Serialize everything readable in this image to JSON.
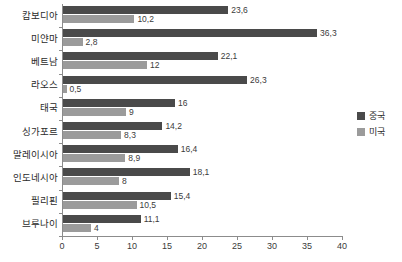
{
  "chart_data": {
    "type": "bar",
    "orientation": "horizontal",
    "title": "",
    "subtitle": "",
    "xlabel": "",
    "ylabel": "",
    "xlim": [
      0,
      40
    ],
    "xticks": [
      0,
      5,
      10,
      15,
      20,
      25,
      30,
      35,
      40
    ],
    "xtick_labels": [
      "0",
      "5",
      "10",
      "15",
      "20",
      "25",
      "30",
      "35",
      "40"
    ],
    "grid": false,
    "legend_position": "right",
    "decimal_separator": ",",
    "categories": [
      "캄보디아",
      "미얀마",
      "베트남",
      "라오스",
      "태국",
      "싱가포르",
      "말레이시아",
      "인도네시아",
      "필리핀",
      "브루나이"
    ],
    "series": [
      {
        "name": "중국",
        "color": "#4a4a4a",
        "values": [
          23.6,
          36.3,
          22.1,
          26.3,
          16,
          14.2,
          16.4,
          18.1,
          15.4,
          11.1
        ],
        "labels": [
          "23,6",
          "36,3",
          "22,1",
          "26,3",
          "16",
          "14,2",
          "16,4",
          "18,1",
          "15,4",
          "11,1"
        ]
      },
      {
        "name": "미국",
        "color": "#9b9b9b",
        "values": [
          10.2,
          2.8,
          12,
          0.5,
          9,
          8.3,
          8.9,
          8,
          10.5,
          4
        ],
        "labels": [
          "10,2",
          "2,8",
          "12",
          "0,5",
          "9",
          "8,3",
          "8,9",
          "8",
          "10,5",
          "4"
        ]
      }
    ]
  },
  "legend": {
    "items": [
      {
        "label": "중국",
        "color": "#4a4a4a"
      },
      {
        "label": "미국",
        "color": "#9b9b9b"
      }
    ]
  }
}
